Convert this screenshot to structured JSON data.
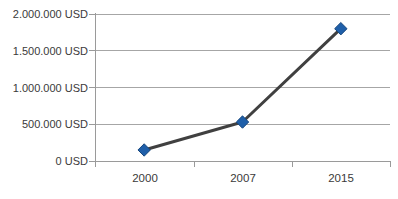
{
  "chart_data": {
    "type": "line",
    "title": "",
    "subtitle": "",
    "xlabel": "",
    "ylabel": "",
    "categories": [
      "2000",
      "2007",
      "2015"
    ],
    "values": [
      150000,
      530000,
      1800000
    ],
    "series": [
      {
        "name": "USD",
        "values": [
          150000,
          530000,
          1800000
        ],
        "line_color": "#404040",
        "marker_color": "#1F5FA9",
        "marker_shape": "diamond"
      }
    ],
    "ylim": [
      0,
      2000000
    ],
    "ytick_values": [
      0,
      500000,
      1000000,
      1500000,
      2000000
    ],
    "ytick_labels": [
      "0 USD",
      "500.000 USD",
      "1.000.000 USD",
      "1.500.000 USD",
      "2.000.000 USD"
    ],
    "xtick_labels": [
      "2000",
      "2007",
      "2015"
    ],
    "grid": true,
    "grid_axis": "y",
    "legend": false,
    "legend_position": "none",
    "annotations": []
  },
  "colors": {
    "gridline": "#A6A6A6",
    "axis": "#9A9A9A",
    "line": "#404040",
    "marker_fill": "#1F5FA9",
    "marker_stroke": "#17477E",
    "text": "#3A3A3A",
    "background": "#FFFFFF"
  }
}
